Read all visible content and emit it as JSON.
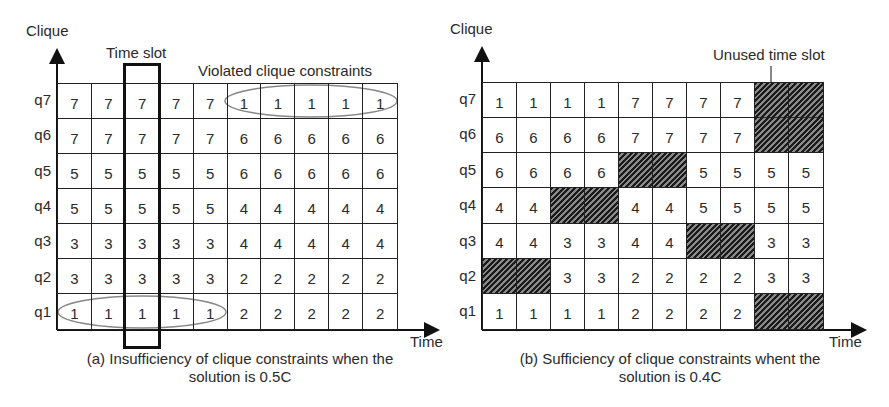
{
  "panel_a": {
    "y_axis_label": "Clique",
    "x_axis_label": "Time",
    "annotation_time_slot": "Time slot",
    "annotation_violated": "Violated clique constraints",
    "caption_line1": "(a) Insufficiency of clique constraints when the",
    "caption_line2": "solution is 0.5C",
    "rows": [
      {
        "label": "q7",
        "cells": [
          "7",
          "7",
          "7",
          "7",
          "7",
          "1",
          "1",
          "1",
          "1",
          "1"
        ]
      },
      {
        "label": "q6",
        "cells": [
          "7",
          "7",
          "7",
          "7",
          "7",
          "6",
          "6",
          "6",
          "6",
          "6"
        ]
      },
      {
        "label": "q5",
        "cells": [
          "5",
          "5",
          "5",
          "5",
          "5",
          "6",
          "6",
          "6",
          "6",
          "6"
        ]
      },
      {
        "label": "q4",
        "cells": [
          "5",
          "5",
          "5",
          "5",
          "5",
          "4",
          "4",
          "4",
          "4",
          "4"
        ]
      },
      {
        "label": "q3",
        "cells": [
          "3",
          "3",
          "3",
          "3",
          "3",
          "4",
          "4",
          "4",
          "4",
          "4"
        ]
      },
      {
        "label": "q2",
        "cells": [
          "3",
          "3",
          "3",
          "3",
          "3",
          "2",
          "2",
          "2",
          "2",
          "2"
        ]
      },
      {
        "label": "q1",
        "cells": [
          "1",
          "1",
          "1",
          "1",
          "1",
          "2",
          "2",
          "2",
          "2",
          "2"
        ]
      }
    ]
  },
  "panel_b": {
    "y_axis_label": "Clique",
    "x_axis_label": "Time",
    "annotation_unused": "Unused time slot",
    "caption_line1": "(b) Sufficiency of clique constraints whent the",
    "caption_line2": "solution is 0.4C",
    "rows": [
      {
        "label": "q7",
        "cells": [
          "1",
          "1",
          "1",
          "1",
          "7",
          "7",
          "7",
          "7",
          "#",
          "#"
        ]
      },
      {
        "label": "q6",
        "cells": [
          "6",
          "6",
          "6",
          "6",
          "7",
          "7",
          "7",
          "7",
          "#",
          "#"
        ]
      },
      {
        "label": "q5",
        "cells": [
          "6",
          "6",
          "6",
          "6",
          "#",
          "#",
          "5",
          "5",
          "5",
          "5"
        ]
      },
      {
        "label": "q4",
        "cells": [
          "4",
          "4",
          "#",
          "#",
          "4",
          "4",
          "5",
          "5",
          "5",
          "5"
        ]
      },
      {
        "label": "q3",
        "cells": [
          "4",
          "4",
          "3",
          "3",
          "4",
          "4",
          "#",
          "#",
          "3",
          "3"
        ]
      },
      {
        "label": "q2",
        "cells": [
          "#",
          "#",
          "3",
          "3",
          "2",
          "2",
          "2",
          "2",
          "3",
          "3"
        ]
      },
      {
        "label": "q1",
        "cells": [
          "1",
          "1",
          "1",
          "1",
          "2",
          "2",
          "2",
          "2",
          "#",
          "#"
        ]
      }
    ]
  },
  "legend": {
    "unused_marker": "#"
  }
}
